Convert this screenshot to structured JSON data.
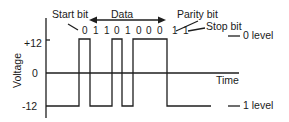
{
  "diagram": {
    "title_labels": {
      "start_bit": "Start bit",
      "data": "Data",
      "parity_bit": "Parity bit",
      "stop_bit": "Stop bit",
      "zero_level": "0 level",
      "one_level": "1 level"
    },
    "axes": {
      "y_label": "Voltage",
      "x_label": "Time",
      "y_ticks": [
        "+12",
        "0",
        "-12"
      ]
    },
    "bits": [
      "0",
      "1",
      "1",
      "0",
      "1",
      "0",
      "0",
      "0",
      "1",
      "1"
    ],
    "bit_roles": [
      "start",
      "data",
      "data",
      "data",
      "data",
      "data",
      "data",
      "data",
      "parity",
      "stop"
    ],
    "levels": {
      "high_voltage": 12,
      "low_voltage": -12,
      "high_meaning": "0 level",
      "low_meaning": "1 level"
    },
    "colors": {
      "line": "#1e1e1e",
      "text": "#1a1a1a",
      "background": "#ffffff"
    }
  }
}
